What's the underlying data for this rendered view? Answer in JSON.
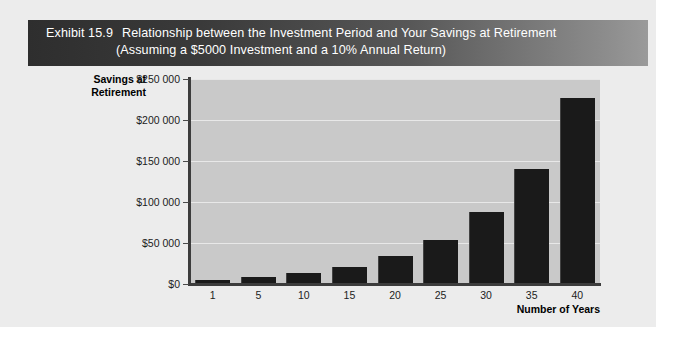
{
  "exhibit": {
    "number": "Exhibit 15.9",
    "title_line1": "Relationship between the Investment Period and Your Savings at Retirement",
    "title_line2": "(Assuming a $5000 Investment and a 10% Annual Return)"
  },
  "colors": {
    "banner_dark": "#2e2e2e",
    "banner_light": "#9a9a9a",
    "plot_background": "#c9c9c9",
    "bar": "#1a1a1a",
    "gridline": "#e8e8e8",
    "page": "#ececec",
    "axis": "#3c3c3c"
  },
  "chart_data": {
    "type": "bar",
    "title": "Relationship between the Investment Period and Your Savings at Retirement",
    "subtitle": "(Assuming a $5000 Investment and a 10% Annual Return)",
    "xlabel": "Number of Years",
    "ylabel": "Savings at Retirement",
    "categories": [
      "1",
      "5",
      "10",
      "15",
      "20",
      "25",
      "30",
      "35",
      "40"
    ],
    "values": [
      5500,
      8050,
      12970,
      20890,
      33640,
      54170,
      87250,
      140510,
      226300
    ],
    "ylim": [
      0,
      250000
    ],
    "ytick_values": [
      0,
      50000,
      100000,
      150000,
      200000,
      250000
    ],
    "ytick_labels": [
      "$0",
      "$50 000",
      "$100 000",
      "$150 000",
      "$200 000",
      "$250 000"
    ],
    "grid": true,
    "legend": null
  }
}
